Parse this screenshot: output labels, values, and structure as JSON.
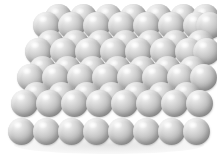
{
  "figure": {
    "name": "close-packed-sphere-lattice",
    "title": "",
    "caption": "",
    "background_color": "#ffffff",
    "sphere_color": "#b3b3b3",
    "sphere_highlight_color": "#fbfbfb",
    "sphere_shadow_color": "#8e8e8e",
    "width": 217,
    "height": 160
  },
  "chart_data": {
    "type": "scatter",
    "title": "",
    "subtitle": "",
    "xlabel": "",
    "ylabel": "",
    "xlim": [
      0,
      217
    ],
    "ylim": [
      0,
      160
    ],
    "grid": false,
    "legend": [],
    "annotations": [],
    "marker": "sphere",
    "sphere_diameter": 27,
    "row_count": 5,
    "columns_per_row": 8,
    "row_vertical_pitch": 27,
    "row_horizontal_offset": -8,
    "rows": [
      {
        "index": 0,
        "label": "row-1",
        "y": 12,
        "x_start": 33,
        "back_layer": true,
        "sphere_count": 8,
        "x": [
          33,
          58,
          83,
          108,
          133,
          158,
          183,
          196
        ],
        "back_y": 4,
        "back_x": [
          45,
          70,
          95,
          120,
          145,
          170,
          192
        ]
      },
      {
        "index": 1,
        "label": "row-2",
        "y": 38,
        "x_start": 25,
        "back_layer": true,
        "sphere_count": 8,
        "x": [
          25,
          50,
          75,
          100,
          125,
          150,
          175,
          193
        ],
        "back_y": 30,
        "back_x": [
          37,
          62,
          87,
          112,
          137,
          162,
          187
        ]
      },
      {
        "index": 2,
        "label": "row-3",
        "y": 64,
        "x_start": 17,
        "back_layer": true,
        "sphere_count": 8,
        "x": [
          17,
          42,
          67,
          92,
          117,
          142,
          167,
          190
        ],
        "back_y": 56,
        "back_x": [
          29,
          54,
          79,
          104,
          129,
          154,
          179
        ]
      },
      {
        "index": 3,
        "label": "row-4",
        "y": 90,
        "x_start": 11,
        "back_layer": true,
        "sphere_count": 8,
        "x": [
          11,
          36,
          61,
          86,
          111,
          136,
          161,
          186
        ],
        "back_y": 82,
        "back_x": [
          23,
          48,
          73,
          98,
          123,
          148,
          173
        ]
      },
      {
        "index": 4,
        "label": "row-5",
        "y": 118,
        "x_start": 8,
        "back_layer": false,
        "sphere_count": 8,
        "x": [
          8,
          33,
          58,
          83,
          108,
          133,
          158,
          183
        ],
        "back_y": 110,
        "back_x": []
      }
    ]
  }
}
